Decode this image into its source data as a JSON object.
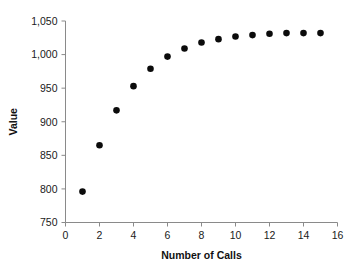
{
  "chart_data": {
    "type": "scatter",
    "title": "",
    "xlabel": "Number of Calls",
    "ylabel": "Value",
    "x": [
      1,
      2,
      3,
      4,
      5,
      6,
      7,
      8,
      9,
      10,
      11,
      12,
      13,
      14,
      15
    ],
    "values": [
      796,
      865,
      917,
      953,
      979,
      997,
      1009,
      1018,
      1023,
      1027,
      1029,
      1031,
      1032,
      1032,
      1032
    ],
    "series": [
      {
        "name": "Value",
        "values": [
          796,
          865,
          917,
          953,
          979,
          997,
          1009,
          1018,
          1023,
          1027,
          1029,
          1031,
          1032,
          1032,
          1032
        ]
      }
    ],
    "xlim": [
      0,
      16
    ],
    "ylim": [
      750,
      1050
    ],
    "xticks": [
      0,
      2,
      4,
      6,
      8,
      10,
      12,
      14,
      16
    ],
    "xtick_labels": [
      "0",
      "2",
      "4",
      "6",
      "8",
      "10",
      "12",
      "14",
      "16"
    ],
    "yticks": [
      750,
      800,
      850,
      900,
      950,
      1000,
      1050
    ],
    "ytick_labels": [
      "750",
      "800",
      "850",
      "900",
      "950",
      "1,000",
      "1,050"
    ],
    "grid": false,
    "legend": false,
    "legend_position": "none",
    "marker": "filled-circle",
    "marker_color": "#0b0b0b",
    "axis_color": "#8a8a8a",
    "background_color": "#ffffff"
  }
}
